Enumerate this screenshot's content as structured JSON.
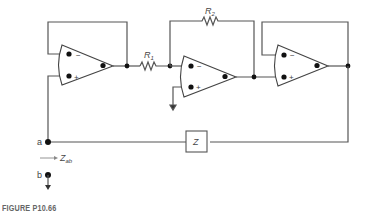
{
  "figure": {
    "caption": "FIGURE P10.66",
    "labels": {
      "r1": "R1",
      "r1_main": "R",
      "r1_sub": "1",
      "r2_main": "R",
      "r2_sub": "2",
      "z": "Z",
      "node_a": "a",
      "node_b": "b",
      "zab_main": "Z",
      "zab_sub": "ab",
      "minus": "−",
      "plus": "+"
    },
    "components": [
      {
        "id": "opamp-1",
        "type": "op-amp",
        "config": "voltage follower"
      },
      {
        "id": "R1",
        "type": "resistor"
      },
      {
        "id": "opamp-2",
        "type": "op-amp",
        "config": "inverting amplifier"
      },
      {
        "id": "R2",
        "type": "resistor",
        "role": "feedback"
      },
      {
        "id": "opamp-3",
        "type": "op-amp",
        "config": "voltage follower"
      },
      {
        "id": "Z",
        "type": "impedance"
      }
    ]
  }
}
